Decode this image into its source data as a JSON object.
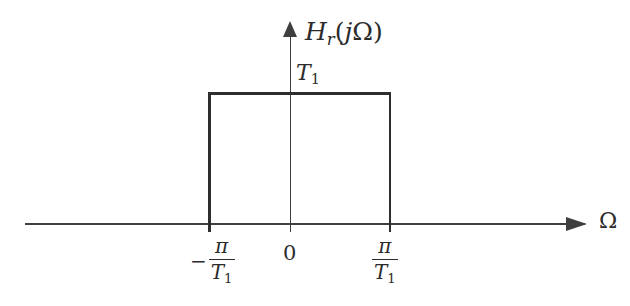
{
  "figure": {
    "background_color": "#ffffff",
    "line_color": "#2e2e2e",
    "axis_color": "#3f3f3f",
    "text_color": "#2b2b2b"
  },
  "axes": {
    "vertical": {
      "label_html_parts": {
        "function": "H",
        "subscript": "r",
        "argument_open": "(",
        "imaginary_unit": "j",
        "variable": "Ω",
        "argument_close": ")"
      },
      "label_text": "Hᵣ(jΩ)",
      "has_arrow": true
    },
    "horizontal": {
      "label_text": "Ω",
      "has_arrow": true
    }
  },
  "annotations": {
    "amplitude": {
      "symbol": "T",
      "subscript": "1",
      "text": "T₁"
    }
  },
  "ticks": [
    {
      "name": "negative-cutoff",
      "sign": "−",
      "numerator": "π",
      "denominator_symbol": "T",
      "denominator_subscript": "1",
      "text": "−π/T₁",
      "x_px": 209
    },
    {
      "name": "origin",
      "text": "0",
      "x_px": 290
    },
    {
      "name": "positive-cutoff",
      "sign": "",
      "numerator": "π",
      "denominator_symbol": "T",
      "denominator_subscript": "1",
      "text": "π/T₁",
      "x_px": 390
    }
  ],
  "chart_data": {
    "type": "line",
    "xlabel": "Ω",
    "ylabel": "H_r(jΩ)",
    "grid": false,
    "legend": "none",
    "xtick_labels": [
      "−π/T₁",
      "0",
      "π/T₁"
    ],
    "xtick_values": [
      -1,
      0,
      1
    ],
    "ytick_labels": [
      "T₁"
    ],
    "ytick_values": [
      1
    ],
    "xlim": [
      -2.85,
      3.2
    ],
    "ylim": [
      0,
      1.45
    ],
    "series": [
      {
        "name": "H_r(jΩ)",
        "x": [
          -2.85,
          -1,
          -1,
          1,
          1,
          3.2
        ],
        "values": [
          0,
          0,
          1,
          1,
          0,
          0
        ]
      }
    ]
  }
}
